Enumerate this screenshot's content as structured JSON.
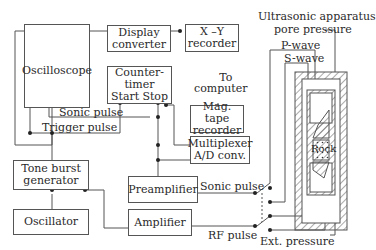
{
  "diagram": {
    "blocks": {
      "oscilloscope": "Oscilloscope",
      "display_converter_1": "Display",
      "display_converter_2": "converter",
      "xy_recorder_1": "X –Y",
      "xy_recorder_2": "recorder",
      "counter_timer_1": "Counter-",
      "counter_timer_2": "timer",
      "start": "Start",
      "stop": "Stop",
      "mag_tape_1": "Mag. tape",
      "mag_tape_2": "recorder",
      "multiplexer_1": "Multiplexer",
      "multiplexer_2": "A/D conv.",
      "tone_burst_1": "Tone burst",
      "tone_burst_2": "generator",
      "oscillator": "Oscillator",
      "preamplifier": "Preamplifier",
      "amplifier": "Amplifier"
    },
    "labels": {
      "to_computer_1": "To",
      "to_computer_2": "computer",
      "sonic_pulse_top": "Sonic pulse",
      "trigger_pulse": "Trigger pulse",
      "sonic_pulse_right": "Sonic pulse",
      "rf_pulse": "RF pulse",
      "ultrasonic_1": "Ultrasonic apparatus",
      "ultrasonic_2": "pore pressure",
      "p_wave": "P-wave",
      "s_wave": "S-wave",
      "rock": "Rock",
      "ext_pressure": "Ext. pressure"
    }
  }
}
